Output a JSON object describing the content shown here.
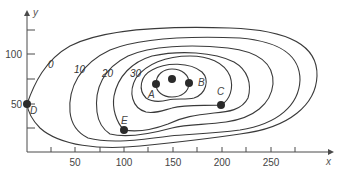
{
  "diagram": {
    "type": "contour-map",
    "axes": {
      "x_label": "x",
      "y_label": "y",
      "x_ticks": [
        "50",
        "100",
        "150",
        "200",
        "250"
      ],
      "y_ticks": [
        "50",
        "100"
      ]
    },
    "contour_labels": [
      "0",
      "10",
      "20",
      "30"
    ],
    "points": [
      {
        "label": "A",
        "x": 130,
        "y": 70
      },
      {
        "label": "B",
        "x": 165,
        "y": 71
      },
      {
        "label": "C",
        "x": 198,
        "y": 49
      },
      {
        "label": "D",
        "x": 0,
        "y": 50
      },
      {
        "label": "E",
        "x": 100,
        "y": 24
      },
      {
        "label": "",
        "x": 147,
        "y": 75
      }
    ],
    "colors": {
      "line": "#3a3a3a",
      "point": "#2a2a2a",
      "background": "#ffffff"
    }
  }
}
